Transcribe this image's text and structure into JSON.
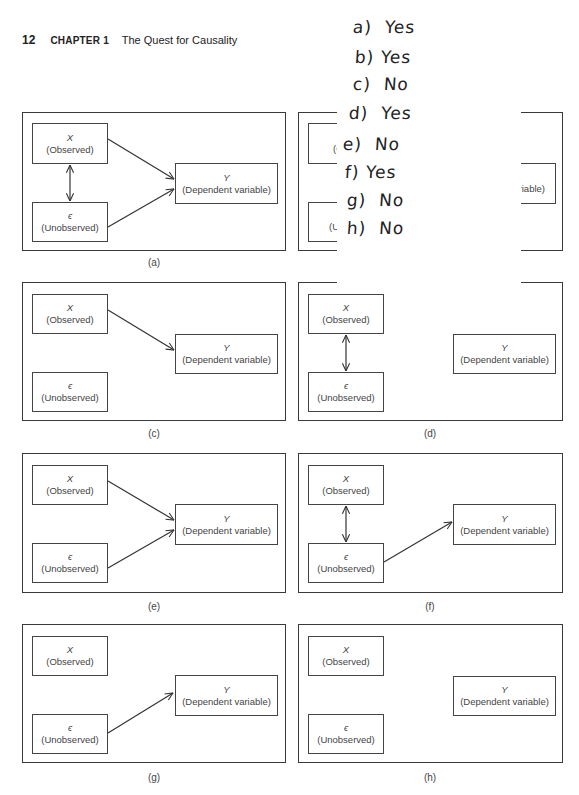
{
  "header": {
    "page_number": "12",
    "chapter": "CHAPTER 1",
    "title": "The Quest for Causality"
  },
  "node_labels": {
    "x_symbol": "X",
    "x_desc": "(Observed)",
    "eps_symbol": "ϵ",
    "eps_desc": "(Unobserved)",
    "y_symbol": "Y",
    "y_desc": "(Dependent variable)"
  },
  "panels": [
    {
      "id": "a",
      "caption": "(a)",
      "x_to_y": true,
      "eps_to_y": true,
      "x_eps_corr": true
    },
    {
      "id": "b",
      "caption": "(b)",
      "x_to_y": null,
      "eps_to_y": null,
      "x_eps_corr": null,
      "partially_hidden": true
    },
    {
      "id": "c",
      "caption": "(c)",
      "x_to_y": true,
      "eps_to_y": false,
      "x_eps_corr": false
    },
    {
      "id": "d",
      "caption": "(d)",
      "x_to_y": false,
      "eps_to_y": false,
      "x_eps_corr": true
    },
    {
      "id": "e",
      "caption": "(e)",
      "x_to_y": true,
      "eps_to_y": true,
      "x_eps_corr": false
    },
    {
      "id": "f",
      "caption": "(f)",
      "x_to_y": false,
      "eps_to_y": true,
      "x_eps_corr": true
    },
    {
      "id": "g",
      "caption": "(g)",
      "x_to_y": false,
      "eps_to_y": true,
      "x_eps_corr": false
    },
    {
      "id": "h",
      "caption": "(h)",
      "x_to_y": false,
      "eps_to_y": false,
      "x_eps_corr": false
    }
  ],
  "b_visible_fragments": {
    "x_desc": "(Ob",
    "eps_desc": "(Unc",
    "y_desc": "riable)"
  },
  "handwritten_note": {
    "answers": [
      {
        "letter": "a)",
        "answer": "Yes"
      },
      {
        "letter": "b)",
        "answer": "Yes"
      },
      {
        "letter": "c)",
        "answer": "No"
      },
      {
        "letter": "d)",
        "answer": "Yes"
      },
      {
        "letter": "e)",
        "answer": "No"
      },
      {
        "letter": "f)",
        "answer": "Yes"
      },
      {
        "letter": "g)",
        "answer": "No"
      },
      {
        "letter": "h)",
        "answer": "No"
      }
    ]
  },
  "colors": {
    "ink": "#333333",
    "border": "#3a3a3a",
    "background": "#ffffff"
  }
}
